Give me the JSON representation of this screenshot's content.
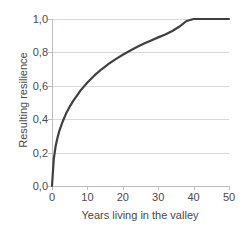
{
  "chart_data": {
    "type": "line",
    "title": "",
    "xlabel": "Years living in the valley",
    "ylabel": "Resulting resilience",
    "xlim": [
      0,
      50
    ],
    "ylim": [
      0,
      1.0
    ],
    "grid": true,
    "legend": null,
    "x_ticks": [
      0,
      10,
      20,
      30,
      40,
      50
    ],
    "x_tick_labels": [
      "0",
      "10",
      "20",
      "30",
      "40",
      "50"
    ],
    "y_ticks": [
      0.0,
      0.2,
      0.4,
      0.6,
      0.8,
      1.0
    ],
    "y_tick_labels": [
      "0,0",
      "0,2",
      "0,4",
      "0,6",
      "0,8",
      "1,0"
    ],
    "series": [
      {
        "name": "Resulting resilience",
        "color": "#404040",
        "x": [
          0,
          0.5,
          1,
          1.5,
          2,
          3,
          4,
          5,
          6,
          7,
          8,
          9,
          10,
          12,
          14,
          16,
          18,
          20,
          22,
          24,
          26,
          28,
          30,
          32,
          34,
          36,
          38,
          40,
          44,
          46,
          50
        ],
        "y": [
          0.0,
          0.16,
          0.235,
          0.285,
          0.325,
          0.385,
          0.435,
          0.475,
          0.51,
          0.54,
          0.57,
          0.595,
          0.62,
          0.662,
          0.699,
          0.731,
          0.76,
          0.786,
          0.81,
          0.832,
          0.853,
          0.872,
          0.89,
          0.907,
          0.928,
          0.955,
          0.988,
          1.0,
          1.0,
          1.0,
          1.0
        ]
      }
    ]
  },
  "colors": {
    "curve": "#404040",
    "gridline": "#d9d9d9",
    "axis": "#bdbdbd",
    "text": "#4a4a4a",
    "background": "#ffffff"
  }
}
